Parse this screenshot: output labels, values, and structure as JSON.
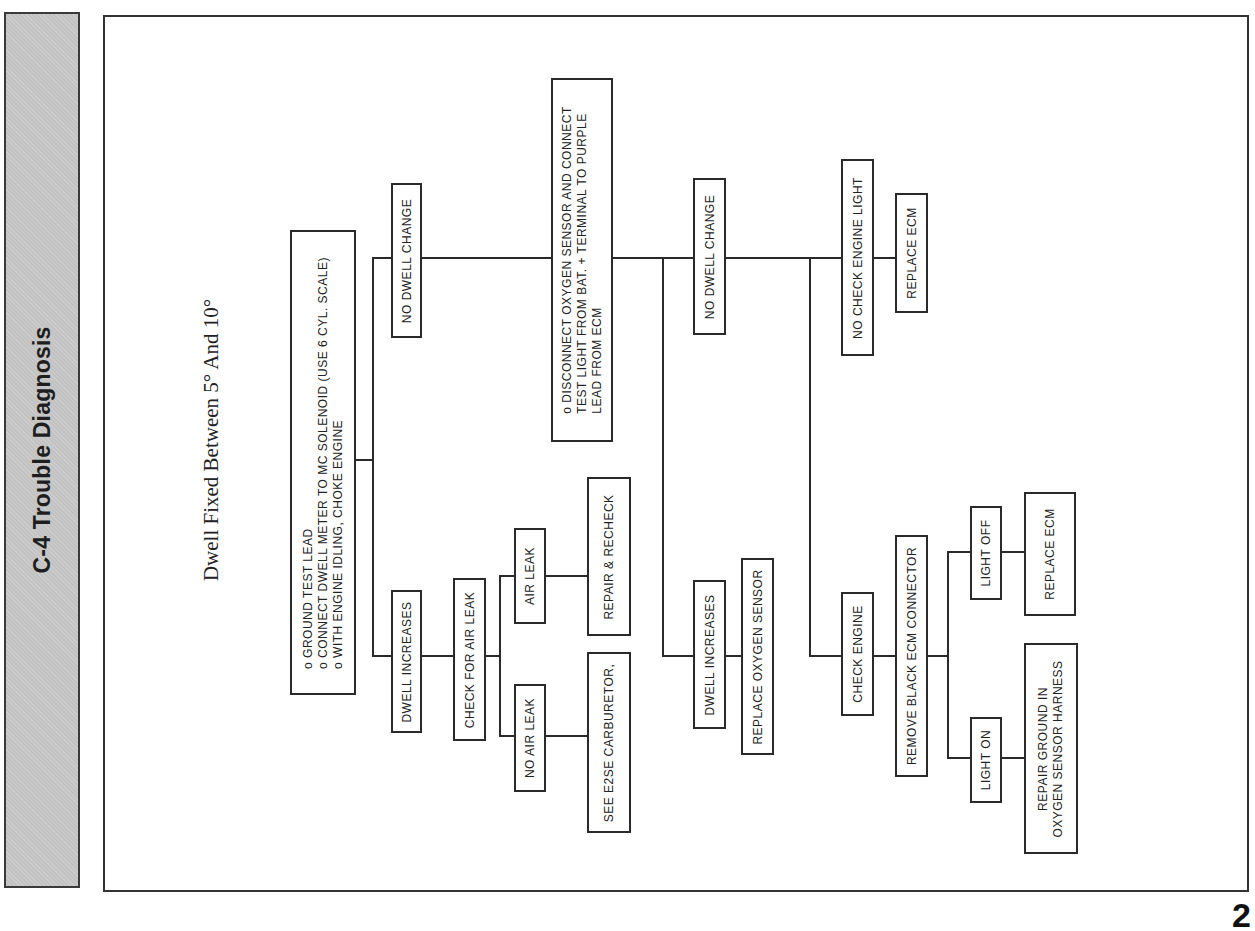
{
  "sidebar": {
    "title": "C-4 Trouble Diagnosis"
  },
  "diagram": {
    "heading": "Dwell Fixed Between 5° And 10°",
    "nodes": {
      "start": {
        "lines": [
          "o  GROUND TEST LEAD",
          "o  CONNECT DWELL METER TO MC SOLENOID (USE 6 CYL. SCALE)",
          "o  WITH ENGINE IDLING, CHOKE ENGINE"
        ]
      },
      "no_dwell_change_1": "NO DWELL CHANGE",
      "dwell_increases_1": "DWELL INCREASES",
      "check_air_leak": "CHECK FOR AIR LEAK",
      "air_leak": "AIR LEAK",
      "no_air_leak": "NO AIR LEAK",
      "repair_recheck": "REPAIR & RECHECK",
      "see_e2se": "SEE E2SE CARBURETOR,",
      "disconnect_o2": {
        "lines": [
          "o  DISCONNECT OXYGEN SENSOR AND CONNECT",
          "    TEST LIGHT FROM BAT. + TERMINAL TO PURPLE",
          "    LEAD FROM ECM"
        ]
      },
      "no_dwell_change_2": "NO DWELL CHANGE",
      "dwell_increases_2": "DWELL INCREASES",
      "replace_o2": "REPLACE OXYGEN SENSOR",
      "no_check_engine_light": "NO CHECK ENGINE LIGHT",
      "replace_ecm_1": "REPLACE ECM",
      "check_engine": "CHECK ENGINE",
      "remove_black_ecm": "REMOVE BLACK ECM CONNECTOR",
      "light_off": "LIGHT OFF",
      "light_on": "LIGHT ON",
      "replace_ecm_2": "REPLACE ECM",
      "repair_ground": {
        "lines": [
          "REPAIR GROUND IN",
          "OXYGEN  SENSOR HARNESS"
        ]
      }
    }
  },
  "page": {
    "number": "2"
  }
}
